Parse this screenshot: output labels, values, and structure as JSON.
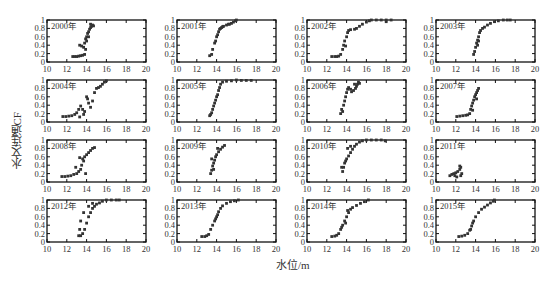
{
  "chart_data": {
    "type": "scatter",
    "layout": {
      "rows": 4,
      "cols": 4,
      "grid": false,
      "legend": "none"
    },
    "xlabel": "水位/m",
    "ylabel": "水文连通CF",
    "xlim": [
      10,
      20
    ],
    "ylim": [
      0,
      1
    ],
    "xticks": [
      "10",
      "12",
      "14",
      "16",
      "18",
      "20"
    ],
    "yticks": [
      "0",
      "0.2",
      "0.4",
      "0.6",
      "0.8",
      "1"
    ],
    "marker_color": "#333333",
    "panels": [
      {
        "title": "2000年",
        "points": [
          [
            12.6,
            0.13
          ],
          [
            12.8,
            0.13
          ],
          [
            13.0,
            0.13
          ],
          [
            13.2,
            0.14
          ],
          [
            13.4,
            0.15
          ],
          [
            13.6,
            0.16
          ],
          [
            13.8,
            0.18
          ],
          [
            13.3,
            0.4
          ],
          [
            13.5,
            0.38
          ],
          [
            13.7,
            0.35
          ],
          [
            13.9,
            0.3
          ],
          [
            13.8,
            0.45
          ],
          [
            13.9,
            0.55
          ],
          [
            14.0,
            0.6
          ],
          [
            14.1,
            0.68
          ],
          [
            14.2,
            0.72
          ],
          [
            14.3,
            0.78
          ],
          [
            14.4,
            0.82
          ],
          [
            14.5,
            0.85
          ],
          [
            14.6,
            0.88
          ],
          [
            14.4,
            0.9
          ],
          [
            14.7,
            0.86
          ],
          [
            14.2,
            0.6
          ],
          [
            14.0,
            0.5
          ]
        ]
      },
      {
        "title": "2001年",
        "points": [
          [
            13.3,
            0.15
          ],
          [
            13.5,
            0.18
          ],
          [
            13.6,
            0.3
          ],
          [
            13.8,
            0.45
          ],
          [
            13.9,
            0.5
          ],
          [
            14.0,
            0.6
          ],
          [
            14.1,
            0.65
          ],
          [
            14.2,
            0.72
          ],
          [
            14.3,
            0.78
          ],
          [
            14.5,
            0.82
          ],
          [
            14.7,
            0.85
          ],
          [
            15.0,
            0.88
          ],
          [
            15.3,
            0.9
          ],
          [
            15.5,
            0.92
          ],
          [
            15.7,
            0.95
          ],
          [
            15.9,
            0.98
          ],
          [
            16.0,
            1.0
          ],
          [
            14.4,
            0.8
          ],
          [
            14.6,
            0.84
          ],
          [
            15.2,
            0.9
          ]
        ]
      },
      {
        "title": "2002年",
        "points": [
          [
            12.5,
            0.13
          ],
          [
            12.8,
            0.13
          ],
          [
            13.0,
            0.13
          ],
          [
            13.2,
            0.14
          ],
          [
            13.4,
            0.18
          ],
          [
            13.6,
            0.3
          ],
          [
            13.7,
            0.4
          ],
          [
            13.8,
            0.5
          ],
          [
            13.9,
            0.38
          ],
          [
            14.0,
            0.6
          ],
          [
            14.1,
            0.7
          ],
          [
            14.2,
            0.75
          ],
          [
            14.4,
            0.77
          ],
          [
            14.8,
            0.78
          ],
          [
            15.0,
            0.8
          ],
          [
            15.3,
            0.85
          ],
          [
            15.6,
            0.9
          ],
          [
            16.0,
            0.95
          ],
          [
            16.3,
            0.98
          ],
          [
            16.5,
            1.0
          ],
          [
            17.0,
            1.0
          ],
          [
            17.5,
            1.0
          ],
          [
            18.0,
            1.0
          ],
          [
            18.5,
            1.0
          ],
          [
            18.0,
            0.96
          ]
        ]
      },
      {
        "title": "2003年",
        "points": [
          [
            13.8,
            0.18
          ],
          [
            13.9,
            0.25
          ],
          [
            14.0,
            0.35
          ],
          [
            14.1,
            0.45
          ],
          [
            14.2,
            0.52
          ],
          [
            14.3,
            0.6
          ],
          [
            14.4,
            0.7
          ],
          [
            14.5,
            0.75
          ],
          [
            14.7,
            0.8
          ],
          [
            14.9,
            0.83
          ],
          [
            15.2,
            0.88
          ],
          [
            15.5,
            0.92
          ],
          [
            15.9,
            0.96
          ],
          [
            16.3,
            0.98
          ],
          [
            16.8,
            1.0
          ],
          [
            17.2,
            1.0
          ],
          [
            17.5,
            1.0
          ],
          [
            14.2,
            0.4
          ],
          [
            14.3,
            0.5
          ]
        ]
      },
      {
        "title": "2004年",
        "points": [
          [
            11.6,
            0.13
          ],
          [
            11.9,
            0.13
          ],
          [
            12.2,
            0.14
          ],
          [
            12.5,
            0.15
          ],
          [
            12.8,
            0.18
          ],
          [
            13.0,
            0.22
          ],
          [
            13.2,
            0.3
          ],
          [
            13.4,
            0.38
          ],
          [
            13.6,
            0.3
          ],
          [
            13.8,
            0.25
          ],
          [
            14.0,
            0.6
          ],
          [
            14.1,
            0.55
          ],
          [
            14.2,
            0.45
          ],
          [
            14.4,
            0.35
          ],
          [
            14.6,
            0.5
          ],
          [
            14.8,
            0.7
          ],
          [
            15.0,
            0.8
          ],
          [
            15.2,
            0.82
          ],
          [
            15.4,
            0.85
          ],
          [
            15.6,
            0.9
          ],
          [
            15.8,
            0.95
          ],
          [
            16.0,
            0.98
          ],
          [
            13.3,
            0.12
          ],
          [
            13.7,
            0.18
          ]
        ]
      },
      {
        "title": "2005年",
        "points": [
          [
            13.3,
            0.15
          ],
          [
            13.4,
            0.18
          ],
          [
            13.5,
            0.22
          ],
          [
            13.6,
            0.3
          ],
          [
            13.7,
            0.38
          ],
          [
            13.8,
            0.45
          ],
          [
            13.9,
            0.52
          ],
          [
            14.0,
            0.6
          ],
          [
            14.1,
            0.65
          ],
          [
            14.2,
            0.75
          ],
          [
            14.3,
            0.82
          ],
          [
            14.4,
            0.9
          ],
          [
            14.6,
            0.95
          ],
          [
            15.0,
            0.97
          ],
          [
            15.5,
            0.98
          ],
          [
            16.0,
            1.0
          ],
          [
            16.5,
            0.99
          ],
          [
            17.0,
            0.99
          ],
          [
            17.5,
            0.99
          ]
        ]
      },
      {
        "title": "2006年",
        "points": [
          [
            13.4,
            0.2
          ],
          [
            13.5,
            0.3
          ],
          [
            13.6,
            0.25
          ],
          [
            13.7,
            0.4
          ],
          [
            13.8,
            0.5
          ],
          [
            13.9,
            0.6
          ],
          [
            14.0,
            0.7
          ],
          [
            14.1,
            0.78
          ],
          [
            14.2,
            0.82
          ],
          [
            14.4,
            0.78
          ],
          [
            14.5,
            0.72
          ],
          [
            14.7,
            0.75
          ],
          [
            14.9,
            0.8
          ],
          [
            15.0,
            0.85
          ],
          [
            15.1,
            0.9
          ],
          [
            15.2,
            0.95
          ],
          [
            14.8,
            0.9
          ],
          [
            15.3,
            0.92
          ]
        ]
      },
      {
        "title": "2007年",
        "points": [
          [
            12.1,
            0.13
          ],
          [
            12.4,
            0.14
          ],
          [
            12.7,
            0.15
          ],
          [
            13.0,
            0.16
          ],
          [
            13.2,
            0.17
          ],
          [
            13.4,
            0.2
          ],
          [
            13.5,
            0.3
          ],
          [
            13.6,
            0.38
          ],
          [
            13.7,
            0.45
          ],
          [
            13.8,
            0.52
          ],
          [
            13.9,
            0.6
          ],
          [
            14.0,
            0.65
          ],
          [
            14.1,
            0.7
          ],
          [
            14.2,
            0.75
          ],
          [
            14.3,
            0.8
          ],
          [
            13.7,
            0.28
          ],
          [
            14.1,
            0.55
          ]
        ]
      },
      {
        "title": "2008年",
        "points": [
          [
            11.5,
            0.13
          ],
          [
            11.8,
            0.13
          ],
          [
            12.1,
            0.14
          ],
          [
            12.4,
            0.15
          ],
          [
            12.7,
            0.18
          ],
          [
            13.0,
            0.2
          ],
          [
            13.2,
            0.25
          ],
          [
            13.4,
            0.3
          ],
          [
            13.5,
            0.4
          ],
          [
            13.6,
            0.55
          ],
          [
            13.7,
            0.5
          ],
          [
            13.8,
            0.6
          ],
          [
            14.0,
            0.65
          ],
          [
            14.2,
            0.7
          ],
          [
            14.4,
            0.75
          ],
          [
            14.6,
            0.8
          ],
          [
            14.8,
            0.82
          ],
          [
            13.9,
            0.2
          ],
          [
            13.3,
            0.58
          ],
          [
            12.9,
            0.35
          ]
        ]
      },
      {
        "title": "2009年",
        "points": [
          [
            13.4,
            0.2
          ],
          [
            13.5,
            0.28
          ],
          [
            13.6,
            0.38
          ],
          [
            13.7,
            0.45
          ],
          [
            13.8,
            0.52
          ],
          [
            13.9,
            0.6
          ],
          [
            14.0,
            0.65
          ],
          [
            14.2,
            0.72
          ],
          [
            14.4,
            0.78
          ],
          [
            14.6,
            0.83
          ],
          [
            14.8,
            0.87
          ],
          [
            13.5,
            0.55
          ],
          [
            13.7,
            0.3
          ],
          [
            14.1,
            0.8
          ]
        ]
      },
      {
        "title": "2010年",
        "points": [
          [
            13.6,
            0.25
          ],
          [
            13.7,
            0.35
          ],
          [
            13.8,
            0.45
          ],
          [
            13.9,
            0.5
          ],
          [
            14.0,
            0.55
          ],
          [
            14.2,
            0.62
          ],
          [
            14.4,
            0.7
          ],
          [
            14.6,
            0.78
          ],
          [
            14.8,
            0.85
          ],
          [
            15.0,
            0.9
          ],
          [
            15.3,
            0.95
          ],
          [
            15.6,
            0.98
          ],
          [
            16.0,
            1.0
          ],
          [
            16.5,
            1.0
          ],
          [
            17.0,
            1.0
          ],
          [
            17.5,
            1.0
          ],
          [
            17.9,
            0.98
          ],
          [
            13.5,
            0.35
          ],
          [
            14.1,
            0.8
          ],
          [
            14.4,
            0.85
          ]
        ]
      },
      {
        "title": "2011年",
        "points": [
          [
            11.4,
            0.15
          ],
          [
            11.6,
            0.18
          ],
          [
            11.8,
            0.2
          ],
          [
            12.0,
            0.22
          ],
          [
            12.2,
            0.25
          ],
          [
            12.4,
            0.3
          ],
          [
            12.5,
            0.35
          ],
          [
            12.4,
            0.38
          ],
          [
            12.6,
            0.2
          ],
          [
            11.9,
            0.15
          ],
          [
            12.1,
            0.12
          ],
          [
            12.5,
            0.15
          ]
        ]
      },
      {
        "title": "2012年",
        "points": [
          [
            13.2,
            0.15
          ],
          [
            13.4,
            0.15
          ],
          [
            13.6,
            0.2
          ],
          [
            13.8,
            0.3
          ],
          [
            14.0,
            0.45
          ],
          [
            14.2,
            0.6
          ],
          [
            14.4,
            0.7
          ],
          [
            14.6,
            0.8
          ],
          [
            14.8,
            0.85
          ],
          [
            15.0,
            0.9
          ],
          [
            15.3,
            0.93
          ],
          [
            15.6,
            0.97
          ],
          [
            16.0,
            1.0
          ],
          [
            16.5,
            1.0
          ],
          [
            17.0,
            1.0
          ],
          [
            17.3,
            1.0
          ],
          [
            13.3,
            0.3
          ],
          [
            13.4,
            0.5
          ],
          [
            13.7,
            0.7
          ],
          [
            14.2,
            0.85
          ],
          [
            14.6,
            0.92
          ]
        ]
      },
      {
        "title": "2013年",
        "points": [
          [
            12.5,
            0.13
          ],
          [
            12.8,
            0.13
          ],
          [
            13.0,
            0.15
          ],
          [
            13.2,
            0.18
          ],
          [
            13.4,
            0.3
          ],
          [
            13.6,
            0.4
          ],
          [
            13.8,
            0.5
          ],
          [
            14.0,
            0.6
          ],
          [
            14.2,
            0.72
          ],
          [
            14.4,
            0.8
          ],
          [
            14.6,
            0.86
          ],
          [
            15.0,
            0.92
          ],
          [
            15.4,
            0.96
          ],
          [
            15.8,
            0.98
          ],
          [
            16.2,
            1.0
          ],
          [
            14.1,
            0.65
          ],
          [
            13.9,
            0.55
          ]
        ]
      },
      {
        "title": "2014年",
        "points": [
          [
            12.5,
            0.13
          ],
          [
            12.8,
            0.14
          ],
          [
            13.0,
            0.16
          ],
          [
            13.2,
            0.2
          ],
          [
            13.4,
            0.3
          ],
          [
            13.6,
            0.4
          ],
          [
            13.8,
            0.5
          ],
          [
            14.0,
            0.6
          ],
          [
            14.2,
            0.7
          ],
          [
            14.4,
            0.78
          ],
          [
            14.6,
            0.82
          ],
          [
            15.0,
            0.87
          ],
          [
            15.4,
            0.92
          ],
          [
            15.8,
            0.96
          ],
          [
            16.2,
            1.0
          ],
          [
            14.1,
            0.75
          ],
          [
            13.9,
            0.45
          ],
          [
            13.5,
            0.35
          ]
        ]
      },
      {
        "title": "2015年",
        "points": [
          [
            12.3,
            0.13
          ],
          [
            12.6,
            0.14
          ],
          [
            12.9,
            0.16
          ],
          [
            13.2,
            0.2
          ],
          [
            13.4,
            0.28
          ],
          [
            13.6,
            0.38
          ],
          [
            13.8,
            0.5
          ],
          [
            14.0,
            0.6
          ],
          [
            14.3,
            0.7
          ],
          [
            14.6,
            0.78
          ],
          [
            14.9,
            0.83
          ],
          [
            15.2,
            0.88
          ],
          [
            15.5,
            0.93
          ],
          [
            15.8,
            0.97
          ],
          [
            15.9,
            1.0
          ],
          [
            13.5,
            0.3
          ],
          [
            13.7,
            0.45
          ]
        ]
      }
    ]
  }
}
